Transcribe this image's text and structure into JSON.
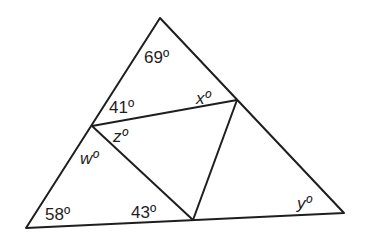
{
  "figure": {
    "type": "triangle-angle-diagram",
    "points": {
      "apex": [
        160,
        18
      ],
      "bottom_left": [
        26,
        228
      ],
      "bottom_right": [
        344,
        213
      ],
      "left_side_point": [
        92,
        126
      ],
      "right_side_point": [
        237,
        100
      ],
      "base_point": [
        193,
        220
      ]
    },
    "segments": [
      [
        "apex",
        "bottom_left"
      ],
      [
        "apex",
        "bottom_right"
      ],
      [
        "bottom_left",
        "bottom_right"
      ],
      [
        "left_side_point",
        "right_side_point"
      ],
      [
        "left_side_point",
        "base_point"
      ],
      [
        "right_side_point",
        "base_point"
      ]
    ],
    "labels": {
      "a69": "69º",
      "a41": "41º",
      "ax": "xº",
      "az": "zº",
      "aw": "wº",
      "a58": "58º",
      "a43": "43º",
      "ay": "yº"
    },
    "stroke_color": "#1e1e1e",
    "background": "#ffffff"
  }
}
